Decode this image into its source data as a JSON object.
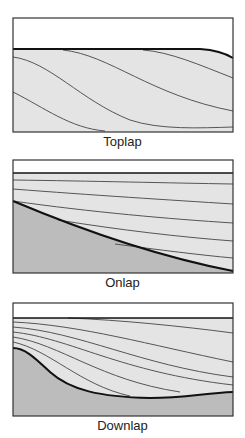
{
  "colors": {
    "sediment_fill": "#e4e4e4",
    "basement_fill": "#bcbcbc",
    "water_fill": "#ffffff",
    "outline": "#333333",
    "thin_line": "#555555",
    "thick_line": "#111111"
  },
  "panels": [
    {
      "id": "toplap",
      "label": "Toplap"
    },
    {
      "id": "onlap",
      "label": "Onlap"
    },
    {
      "id": "downlap",
      "label": "Downlap"
    }
  ]
}
